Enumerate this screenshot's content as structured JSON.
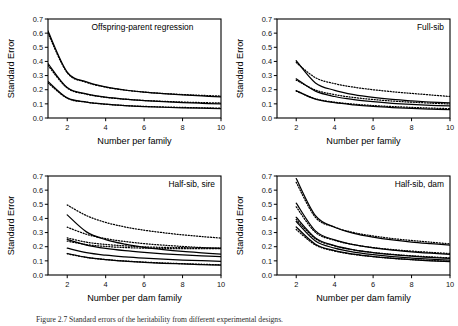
{
  "figure": {
    "width": 458,
    "height": 326,
    "background": "#ffffff",
    "ink_color": "#000000",
    "caption": "Figure 2.7  Standard errors of the heritability from different experimental designs."
  },
  "chart_data": [
    {
      "id": "offspring-parent-regression",
      "type": "line",
      "title": "Offspring-parent regression",
      "panel": "top-left",
      "xlabel": "Number per family",
      "ylabel": "Standard Error",
      "xlim": [
        1,
        10
      ],
      "ylim": [
        0.0,
        0.7
      ],
      "xticks": [
        2,
        4,
        6,
        8,
        10
      ],
      "yticks": [
        0.0,
        0.1,
        0.2,
        0.3,
        0.4,
        0.5,
        0.6,
        0.7
      ],
      "ytick_labels": [
        "0.0",
        "0.1",
        "0.2",
        "0.3",
        "0.4",
        "0.5",
        "0.6",
        "0.7"
      ],
      "grid": false,
      "legend": "none",
      "x": [
        1,
        2,
        3,
        4,
        5,
        6,
        7,
        8,
        9,
        10
      ],
      "series": [
        {
          "name": "h2=0.6 solid",
          "style": "solid",
          "values": [
            0.615,
            0.325,
            0.255,
            0.22,
            0.198,
            0.183,
            0.172,
            0.163,
            0.156,
            0.15
          ]
        },
        {
          "name": "h2=0.6 dotted",
          "style": "dotted",
          "values": [
            0.6,
            0.32,
            0.252,
            0.218,
            0.197,
            0.183,
            0.173,
            0.166,
            0.16,
            0.155
          ]
        },
        {
          "name": "h2=0.3 solid",
          "style": "solid",
          "values": [
            0.385,
            0.215,
            0.17,
            0.147,
            0.133,
            0.123,
            0.115,
            0.109,
            0.104,
            0.1
          ]
        },
        {
          "name": "h2=0.3 dotted",
          "style": "dotted",
          "values": [
            0.372,
            0.212,
            0.168,
            0.146,
            0.133,
            0.124,
            0.118,
            0.113,
            0.109,
            0.106
          ]
        },
        {
          "name": "h2=0.1 solid",
          "style": "solid",
          "values": [
            0.258,
            0.142,
            0.113,
            0.098,
            0.088,
            0.081,
            0.076,
            0.072,
            0.069,
            0.066
          ]
        },
        {
          "name": "h2=0.1 dotted",
          "style": "dotted",
          "values": [
            0.248,
            0.14,
            0.112,
            0.097,
            0.088,
            0.082,
            0.078,
            0.075,
            0.072,
            0.07
          ]
        }
      ]
    },
    {
      "id": "full-sib",
      "type": "line",
      "title": "Full-sib",
      "panel": "top-right",
      "xlabel": "Number per family",
      "ylabel": "Standard Error",
      "xlim": [
        1,
        10
      ],
      "ylim": [
        0.0,
        0.7
      ],
      "xticks": [
        2,
        4,
        6,
        8,
        10
      ],
      "yticks": [
        0.0,
        0.1,
        0.2,
        0.3,
        0.4,
        0.5,
        0.6,
        0.7
      ],
      "ytick_labels": [
        "0.0",
        "0.1",
        "0.2",
        "0.3",
        "0.4",
        "0.5",
        "0.6",
        "0.7"
      ],
      "grid": false,
      "legend": "none",
      "x": [
        2,
        3,
        4,
        5,
        6,
        7,
        8,
        9,
        10
      ],
      "series": [
        {
          "name": "upper solid",
          "style": "solid",
          "values": [
            0.405,
            0.248,
            0.196,
            0.165,
            0.145,
            0.131,
            0.121,
            0.113,
            0.107
          ]
        },
        {
          "name": "upper dotted",
          "style": "dotted",
          "values": [
            0.392,
            0.285,
            0.243,
            0.218,
            0.2,
            0.186,
            0.174,
            0.163,
            0.152
          ]
        },
        {
          "name": "middle solid",
          "style": "solid",
          "values": [
            0.277,
            0.19,
            0.152,
            0.13,
            0.115,
            0.104,
            0.096,
            0.09,
            0.085
          ]
        },
        {
          "name": "middle dotted",
          "style": "dotted",
          "values": [
            0.268,
            0.198,
            0.165,
            0.145,
            0.131,
            0.12,
            0.112,
            0.105,
            0.099
          ]
        },
        {
          "name": "lower solid",
          "style": "solid",
          "values": [
            0.194,
            0.133,
            0.108,
            0.093,
            0.082,
            0.074,
            0.068,
            0.063,
            0.059
          ]
        },
        {
          "name": "lower dotted",
          "style": "dotted",
          "values": [
            0.19,
            0.136,
            0.112,
            0.098,
            0.088,
            0.081,
            0.075,
            0.07,
            0.066
          ]
        }
      ]
    },
    {
      "id": "half-sib-sire",
      "type": "line",
      "title": "Half-sib, sire",
      "panel": "bottom-left",
      "xlabel": "Number per dam family",
      "ylabel": "Standard Error",
      "xlim": [
        1,
        10
      ],
      "ylim": [
        0.0,
        0.7
      ],
      "xticks": [
        2,
        4,
        6,
        8,
        10
      ],
      "yticks": [
        0.0,
        0.1,
        0.2,
        0.3,
        0.4,
        0.5,
        0.6,
        0.7
      ],
      "ytick_labels": [
        "0.0",
        "0.1",
        "0.2",
        "0.3",
        "0.4",
        "0.5",
        "0.6",
        "0.7"
      ],
      "grid": false,
      "legend": "none",
      "x": [
        2,
        3,
        4,
        5,
        6,
        7,
        8,
        9,
        10
      ],
      "series": [
        {
          "name": "top dotted",
          "style": "dotted",
          "values": [
            0.495,
            0.42,
            0.372,
            0.34,
            0.317,
            0.299,
            0.284,
            0.272,
            0.261
          ]
        },
        {
          "name": "top solid",
          "style": "solid",
          "values": [
            0.425,
            0.305,
            0.25,
            0.218,
            0.196,
            0.18,
            0.167,
            0.157,
            0.148
          ]
        },
        {
          "name": "second dotted",
          "style": "dotted",
          "values": [
            0.338,
            0.288,
            0.257,
            0.237,
            0.222,
            0.211,
            0.202,
            0.194,
            0.188
          ]
        },
        {
          "name": "third dotted",
          "style": "dotted",
          "values": [
            0.262,
            0.232,
            0.216,
            0.206,
            0.199,
            0.195,
            0.193,
            0.192,
            0.191
          ]
        },
        {
          "name": "fourth dotted",
          "style": "dotted",
          "values": [
            0.24,
            0.215,
            0.202,
            0.194,
            0.19,
            0.187,
            0.186,
            0.186,
            0.186
          ]
        },
        {
          "name": "middle solid",
          "style": "solid",
          "values": [
            0.252,
            0.212,
            0.188,
            0.172,
            0.16,
            0.15,
            0.142,
            0.136,
            0.13
          ]
        },
        {
          "name": "second solid",
          "style": "solid",
          "values": [
            0.19,
            0.158,
            0.14,
            0.128,
            0.119,
            0.112,
            0.106,
            0.101,
            0.097
          ]
        },
        {
          "name": "bottom solid",
          "style": "solid",
          "values": [
            0.152,
            0.125,
            0.109,
            0.098,
            0.09,
            0.083,
            0.078,
            0.073,
            0.069
          ]
        },
        {
          "name": "bottom dotted",
          "style": "dotted",
          "values": [
            0.15,
            0.124,
            0.109,
            0.099,
            0.091,
            0.085,
            0.08,
            0.076,
            0.072
          ]
        }
      ]
    },
    {
      "id": "half-sib-dam",
      "type": "line",
      "title": "Half-sib, dam",
      "panel": "bottom-right",
      "xlabel": "Number per dam family",
      "ylabel": "Standard Error",
      "xlim": [
        1,
        10
      ],
      "ylim": [
        0.0,
        0.7
      ],
      "xticks": [
        2,
        4,
        6,
        8,
        10
      ],
      "yticks": [
        0.0,
        0.1,
        0.2,
        0.3,
        0.4,
        0.5,
        0.6,
        0.7
      ],
      "ytick_labels": [
        "0.0",
        "0.1",
        "0.2",
        "0.3",
        "0.4",
        "0.5",
        "0.6",
        "0.7"
      ],
      "grid": false,
      "legend": "none",
      "x": [
        2,
        3,
        4,
        5,
        6,
        7,
        8,
        9,
        10
      ],
      "series": [
        {
          "name": "top solid",
          "style": "solid",
          "values": [
            0.682,
            0.42,
            0.338,
            0.295,
            0.268,
            0.248,
            0.233,
            0.222,
            0.212
          ]
        },
        {
          "name": "top dotted",
          "style": "dotted",
          "values": [
            0.655,
            0.408,
            0.338,
            0.3,
            0.276,
            0.258,
            0.244,
            0.232,
            0.22
          ]
        },
        {
          "name": "second solid",
          "style": "solid",
          "values": [
            0.508,
            0.312,
            0.248,
            0.214,
            0.192,
            0.176,
            0.164,
            0.154,
            0.146
          ]
        },
        {
          "name": "second dotted",
          "style": "dotted",
          "values": [
            0.482,
            0.302,
            0.245,
            0.214,
            0.194,
            0.18,
            0.169,
            0.16,
            0.152
          ]
        },
        {
          "name": "third solid",
          "style": "solid",
          "values": [
            0.408,
            0.262,
            0.208,
            0.178,
            0.158,
            0.144,
            0.133,
            0.124,
            0.117
          ]
        },
        {
          "name": "third dotted",
          "style": "dotted",
          "values": [
            0.392,
            0.256,
            0.205,
            0.177,
            0.159,
            0.146,
            0.136,
            0.128,
            0.121
          ]
        },
        {
          "name": "fourth solid",
          "style": "solid",
          "values": [
            0.378,
            0.24,
            0.19,
            0.162,
            0.144,
            0.13,
            0.12,
            0.112,
            0.105
          ]
        },
        {
          "name": "bottom solid",
          "style": "solid",
          "values": [
            0.34,
            0.218,
            0.172,
            0.147,
            0.13,
            0.118,
            0.108,
            0.1,
            0.094
          ]
        },
        {
          "name": "bottom dotted",
          "style": "dotted",
          "values": [
            0.322,
            0.212,
            0.169,
            0.145,
            0.13,
            0.118,
            0.109,
            0.102,
            0.096
          ]
        }
      ]
    }
  ]
}
